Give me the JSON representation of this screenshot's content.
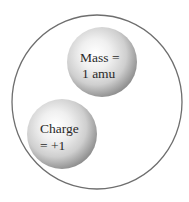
{
  "diagram": {
    "outer_particle": {
      "shape": "circle",
      "stroke_color": "#6e6e6e",
      "fill_color": "#ffffff"
    },
    "spheres": [
      {
        "name": "mass-sphere",
        "lines": [
          "Mass =",
          "1 amu"
        ],
        "highlight_color": "#ffffff",
        "mid_color": "#d4d4d4",
        "shadow_color": "#8c8c8c"
      },
      {
        "name": "charge-sphere",
        "lines": [
          "Charge",
          "= +1"
        ],
        "highlight_color": "#ffffff",
        "mid_color": "#d4d4d4",
        "shadow_color": "#8c8c8c"
      }
    ],
    "text_color": "#2a2a2a"
  }
}
